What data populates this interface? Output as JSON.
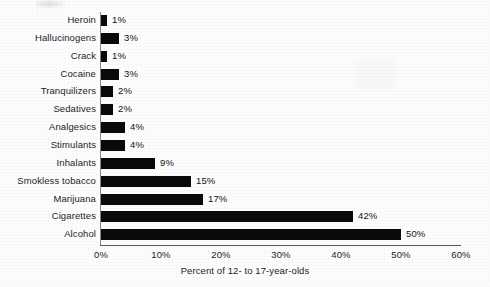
{
  "chart_data": {
    "type": "bar",
    "orientation": "horizontal",
    "title": "",
    "xlabel": "Percent of 12- to 17-year-olds",
    "ylabel": "",
    "xlim": [
      0,
      60
    ],
    "grid": false,
    "legend": null,
    "bar_color": "#0a0a0a",
    "axis_color": "#5a5a5a",
    "xticks": [
      "0%",
      "10%",
      "20%",
      "30%",
      "40%",
      "50%",
      "60%"
    ],
    "xtick_values": [
      0,
      10,
      20,
      30,
      40,
      50,
      60
    ],
    "categories": [
      "Heroin",
      "Hallucinogens",
      "Crack",
      "Cocaine",
      "Tranquilizers",
      "Sedatives",
      "Analgesics",
      "Stimulants",
      "Inhalants",
      "Smokless tobacco",
      "Marijuana",
      "Cigarettes",
      "Alcohol"
    ],
    "values": [
      1,
      3,
      1,
      3,
      2,
      2,
      4,
      4,
      9,
      15,
      17,
      42,
      50
    ],
    "data_labels": [
      "1%",
      "3%",
      "1%",
      "3%",
      "2%",
      "2%",
      "4%",
      "4%",
      "9%",
      "15%",
      "17%",
      "42%",
      "50%"
    ]
  }
}
